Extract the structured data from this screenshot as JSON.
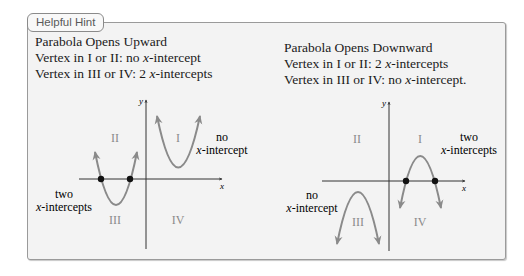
{
  "hint_box": {
    "tag_label": "Helpful Hint"
  },
  "upward": {
    "title": "Parabola Opens Upward",
    "rule1_prefix": "Vertex in I or II: no ",
    "rule1_var": "x",
    "rule1_suffix": "-intercept",
    "rule2_prefix": "Vertex in III or IV: 2 ",
    "rule2_var": "x",
    "rule2_suffix": "-intercepts",
    "graph": {
      "axis_x": "x",
      "axis_y": "y",
      "quadrants": [
        "I",
        "II",
        "III",
        "IV"
      ],
      "label_no_line1": "no",
      "label_no_line2_var": "x",
      "label_no_line2_suffix": "-intercept",
      "label_two_line1": "two",
      "label_two_line2_var": "x",
      "label_two_line2_suffix": "-intercepts"
    }
  },
  "downward": {
    "title": "Parabola Opens Downward",
    "rule1_prefix": "Vertex in I or II: 2 ",
    "rule1_var": "x",
    "rule1_suffix": "-intercepts",
    "rule2_prefix": "Vertex in III or IV: no ",
    "rule2_var": "x",
    "rule2_suffix": "-intercept.",
    "graph": {
      "axis_x": "x",
      "axis_y": "y",
      "quadrants": [
        "I",
        "II",
        "III",
        "IV"
      ],
      "label_two_line1": "two",
      "label_two_line2_var": "x",
      "label_two_line2_suffix": "-intercepts",
      "label_no_line1": "no",
      "label_no_line2_var": "x",
      "label_no_line2_suffix": "-intercept"
    }
  },
  "colors": {
    "box_bg": "#f3f3f3",
    "curve": "#8a8a8a",
    "axis": "#333333",
    "quadrant_label": "#8a8a8a",
    "dot": "#111111"
  }
}
